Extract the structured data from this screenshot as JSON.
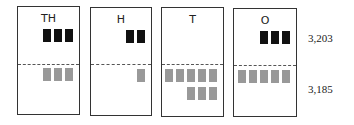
{
  "panels": [
    {
      "label": "TH",
      "top_count": 3,
      "bottom_rows": [
        3
      ]
    },
    {
      "label": "H",
      "top_count": 2,
      "bottom_rows": [
        1
      ]
    },
    {
      "label": "T",
      "top_count": 0,
      "bottom_rows": [
        5,
        3
      ]
    },
    {
      "label": "O",
      "top_count": 3,
      "bottom_rows": [
        5
      ]
    }
  ],
  "values": {
    "top": "3,203",
    "bottom": "3,185"
  },
  "colors": {
    "top_block": "#111111",
    "bottom_block": "#999999"
  }
}
